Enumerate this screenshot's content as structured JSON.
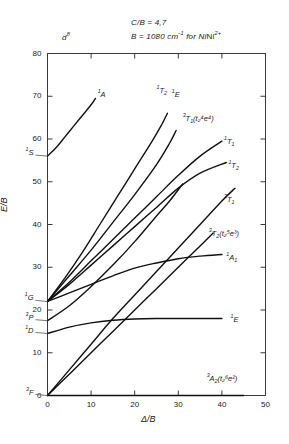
{
  "header": {
    "configuration": "d8",
    "configuration_display": "d",
    "configuration_sup": "8",
    "ratio_label": "C/B = 4,7",
    "racah_label": "B = 1080 cm",
    "racah_sup": "-1",
    "racah_tail": " for Ni",
    "ion_sup": "2+"
  },
  "axes": {
    "x_label": "Δ/B",
    "y_label": "E/B",
    "x_ticks": [
      "0",
      "10",
      "20",
      "30",
      "40",
      "50"
    ],
    "y_ticks": [
      "0",
      "10",
      "20",
      "30",
      "40",
      "50",
      "60",
      "70",
      "80"
    ],
    "xlim": [
      0,
      50
    ],
    "ylim": [
      0,
      80
    ]
  },
  "free_ion_terms": [
    {
      "name": "1S",
      "mult": "1",
      "term": "S",
      "energy": 56.0
    },
    {
      "name": "1G",
      "mult": "1",
      "term": "G",
      "energy": 22.0
    },
    {
      "name": "3P",
      "mult": "3",
      "term": "P",
      "energy": 17.5
    },
    {
      "name": "1D",
      "mult": "1",
      "term": "D",
      "energy": 14.5
    },
    {
      "name": "3F",
      "mult": "3",
      "term": "F",
      "energy": 0.0
    }
  ],
  "state_labels": [
    {
      "id": "1A1-top",
      "mult": "1",
      "term": "A",
      "sub": "",
      "paren": "",
      "x": 11.5,
      "y": 70.5
    },
    {
      "id": "1T2-top",
      "mult": "1",
      "term": "T",
      "sub": "2",
      "paren": "",
      "x": 25.0,
      "y": 71.5
    },
    {
      "id": "1E-top",
      "mult": "1",
      "term": "E",
      "sub": "",
      "paren": "",
      "x": 28.5,
      "y": 70.5
    },
    {
      "id": "3T1-hi",
      "mult": "3",
      "term": "T",
      "sub": "1",
      "paren": "(t₂⁴e⁴)",
      "x": 31.0,
      "y": 65.0
    },
    {
      "id": "1T1",
      "mult": "1",
      "term": "T",
      "sub": "1",
      "paren": "",
      "x": 40.5,
      "y": 59.5
    },
    {
      "id": "1T2",
      "mult": "1",
      "term": "T",
      "sub": "2",
      "paren": "",
      "x": 41.5,
      "y": 54.0
    },
    {
      "id": "3T1",
      "mult": "3",
      "term": "T",
      "sub": "1",
      "paren": "",
      "x": 40.5,
      "y": 46.0
    },
    {
      "id": "3T2",
      "mult": "3",
      "term": "T",
      "sub": "2",
      "paren": "(t₂⁵e³)",
      "x": 37.0,
      "y": 38.0
    },
    {
      "id": "1A1",
      "mult": "1",
      "term": "A",
      "sub": "1",
      "paren": "",
      "x": 41.0,
      "y": 32.5
    },
    {
      "id": "1E",
      "mult": "1",
      "term": "E",
      "sub": "",
      "paren": "",
      "x": 42.0,
      "y": 18.0
    },
    {
      "id": "3A2",
      "mult": "3",
      "term": "A",
      "sub": "2",
      "paren": "(t₂⁶e²)",
      "x": 36.5,
      "y": 4.0
    }
  ],
  "chart_data": {
    "type": "line",
    "xlabel": "Δ/B",
    "ylabel": "E/B",
    "xlim": [
      0,
      50
    ],
    "ylim": [
      0,
      80
    ],
    "grid": false,
    "legend": "none",
    "series": [
      {
        "name": "3A2 (t2^6 e^2) ground state",
        "points": [
          [
            0,
            0
          ],
          [
            5,
            0
          ],
          [
            10,
            0
          ],
          [
            15,
            0
          ],
          [
            20,
            0
          ],
          [
            25,
            0
          ],
          [
            30,
            0
          ],
          [
            35,
            0
          ],
          [
            40,
            0
          ],
          [
            45,
            0
          ]
        ]
      },
      {
        "name": "3T2 (t2^5 e^3)",
        "points": [
          [
            0,
            0
          ],
          [
            5,
            5
          ],
          [
            10,
            10
          ],
          [
            15,
            15
          ],
          [
            20,
            20
          ],
          [
            25,
            25
          ],
          [
            30,
            30
          ],
          [
            35,
            35
          ],
          [
            38,
            38
          ]
        ]
      },
      {
        "name": "3T1 (t2^5 e^3)",
        "points": [
          [
            0,
            0
          ],
          [
            5,
            6
          ],
          [
            10,
            12
          ],
          [
            15,
            18
          ],
          [
            20,
            23.5
          ],
          [
            25,
            29
          ],
          [
            30,
            34.5
          ],
          [
            35,
            40
          ],
          [
            40,
            45.5
          ],
          [
            43,
            48.5
          ]
        ]
      },
      {
        "name": "3T1 (t2^4 e^4)",
        "points": [
          [
            0,
            17.5
          ],
          [
            5,
            21
          ],
          [
            10,
            25.5
          ],
          [
            15,
            30.5
          ],
          [
            20,
            36
          ],
          [
            25,
            42
          ],
          [
            28,
            45.5
          ],
          [
            31,
            49.5
          ]
        ]
      },
      {
        "name": "1E (from 1D)",
        "points": [
          [
            0,
            14.5
          ],
          [
            5,
            16
          ],
          [
            10,
            17
          ],
          [
            15,
            17.6
          ],
          [
            20,
            17.9
          ],
          [
            25,
            18
          ],
          [
            30,
            18
          ],
          [
            35,
            18
          ],
          [
            40,
            18
          ]
        ]
      },
      {
        "name": "1A1 (from 1G)",
        "points": [
          [
            0,
            22
          ],
          [
            5,
            24
          ],
          [
            10,
            26
          ],
          [
            15,
            28
          ],
          [
            20,
            29.8
          ],
          [
            25,
            31
          ],
          [
            30,
            32
          ],
          [
            35,
            32.6
          ],
          [
            40,
            33
          ]
        ]
      },
      {
        "name": "1T2 (from 1G)",
        "points": [
          [
            0,
            22
          ],
          [
            5,
            26
          ],
          [
            10,
            30.5
          ],
          [
            15,
            35
          ],
          [
            20,
            39.5
          ],
          [
            25,
            44
          ],
          [
            30,
            48.5
          ],
          [
            35,
            52
          ],
          [
            41,
            54.5
          ]
        ]
      },
      {
        "name": "1T1 (from 1G)",
        "points": [
          [
            0,
            22
          ],
          [
            5,
            26.5
          ],
          [
            10,
            31.5
          ],
          [
            15,
            36.5
          ],
          [
            20,
            41.5
          ],
          [
            25,
            46.5
          ],
          [
            30,
            51.5
          ],
          [
            35,
            56
          ],
          [
            40,
            59.5
          ]
        ]
      },
      {
        "name": "1E (from 1G)",
        "points": [
          [
            0,
            22
          ],
          [
            5,
            28
          ],
          [
            10,
            34
          ],
          [
            15,
            40.5
          ],
          [
            20,
            47
          ],
          [
            25,
            54
          ],
          [
            28,
            59
          ],
          [
            29.5,
            62
          ]
        ]
      },
      {
        "name": "1T2 (upper)",
        "points": [
          [
            0,
            22
          ],
          [
            4,
            27.5
          ],
          [
            8,
            33.5
          ],
          [
            12,
            40
          ],
          [
            16,
            46.5
          ],
          [
            20,
            53
          ],
          [
            24,
            59.5
          ],
          [
            26,
            63
          ],
          [
            27.5,
            66
          ]
        ]
      },
      {
        "name": "1A1 (from 1S)",
        "points": [
          [
            0,
            56
          ],
          [
            2,
            58
          ],
          [
            4,
            60.5
          ],
          [
            6,
            63
          ],
          [
            8,
            65.5
          ],
          [
            10,
            68
          ],
          [
            11,
            69.5
          ]
        ]
      }
    ]
  }
}
